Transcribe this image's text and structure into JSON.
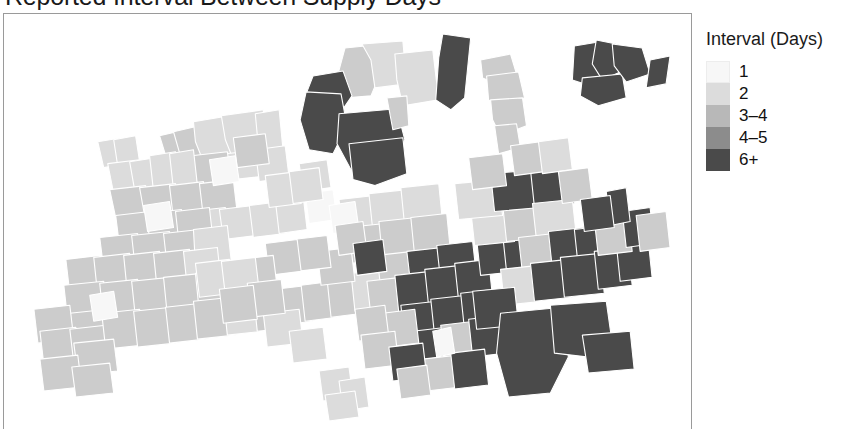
{
  "title": "Reported Interval Between Supply Days",
  "legend": {
    "title": "Interval (Days)",
    "items": [
      {
        "label": "1",
        "color": "#f7f7f7"
      },
      {
        "label": "2",
        "color": "#dcdcdc"
      },
      {
        "label": "3–4",
        "color": "#b8b8b8"
      },
      {
        "label": "4–5",
        "color": "#8c8c8c"
      },
      {
        "label": "6+",
        "color": "#4a4a4a"
      }
    ]
  },
  "chart_data": {
    "type": "map",
    "title": "Reported Interval Between Supply Days",
    "legend_title": "Interval (Days)",
    "categories": [
      "1",
      "2",
      "3–4",
      "4–5",
      "6+"
    ],
    "colors": [
      "#f7f7f7",
      "#dcdcdc",
      "#b8b8b8",
      "#8c8c8c",
      "#4a4a4a"
    ],
    "grid": false,
    "legend_position": "right",
    "panel_background": "#ffffff",
    "polygon_border_color": "#ffffff",
    "region_counts": {
      "1": 6,
      "2": 33,
      "3–4": 41,
      "4–5": 30,
      "6+": 45
    },
    "regions": [
      {
        "id": "r001",
        "class": "4-5",
        "points": "342,34 372,31 376,63 368,82 344,84 335,60"
      },
      {
        "id": "r002",
        "class": "6+",
        "points": "310,62 340,57 349,82 334,104 312,100 303,80"
      },
      {
        "id": "r003",
        "class": "2",
        "points": "359,30 400,27 404,70 372,74 368,46"
      },
      {
        "id": "r004",
        "class": "2",
        "points": "392,40 430,36 436,86 400,92 394,66"
      },
      {
        "id": "r005",
        "class": "6+",
        "points": "440,20 468,24 462,84 448,96 433,86 436,44"
      },
      {
        "id": "r006",
        "class": "6+",
        "points": "303,78 338,80 344,112 330,140 306,136 297,106"
      },
      {
        "id": "r007",
        "class": "6+",
        "points": "336,100 394,95 402,126 388,152 348,156 334,130"
      },
      {
        "id": "r008",
        "class": "6+",
        "points": "346,130 400,124 404,160 372,172 350,166"
      },
      {
        "id": "r009",
        "class": "4-5",
        "points": "384,84 404,82 406,112 390,116"
      },
      {
        "id": "r010",
        "class": "3-4",
        "points": "478,46 508,40 514,60 494,70 480,64"
      },
      {
        "id": "r011",
        "class": "3-4",
        "points": "484,62 516,58 522,84 500,94 486,86"
      },
      {
        "id": "r012",
        "class": "3-4",
        "points": "488,86 520,84 524,112 498,122 490,106"
      },
      {
        "id": "r013",
        "class": "3-4",
        "points": "492,112 514,110 518,134 496,140"
      },
      {
        "id": "r014",
        "class": "6+",
        "points": "572,32 596,28 604,60 588,72 570,66"
      },
      {
        "id": "r015",
        "class": "6+",
        "points": "594,26 614,30 618,58 600,66 590,50"
      },
      {
        "id": "r016",
        "class": "6+",
        "points": "580,64 620,60 624,84 596,92 578,82"
      },
      {
        "id": "r017",
        "class": "6+",
        "points": "610,30 640,34 648,60 624,68 612,52"
      },
      {
        "id": "r018",
        "class": "6+",
        "points": "648,46 668,42 664,70 644,74"
      },
      {
        "id": "r019",
        "class": "4-5",
        "points": "156,122 182,116 186,142 164,148"
      },
      {
        "id": "r020",
        "class": "3-4",
        "points": "170,118 196,112 202,140 178,146"
      },
      {
        "id": "r021",
        "class": "2",
        "points": "190,108 226,102 232,142 200,148 192,128"
      },
      {
        "id": "r022",
        "class": "2",
        "points": "218,102 260,96 264,140 230,146 222,126"
      },
      {
        "id": "r023",
        "class": "2",
        "points": "252,100 276,96 280,138 256,142"
      },
      {
        "id": "r024",
        "class": "2",
        "points": "222,140 262,136 266,162 230,166"
      },
      {
        "id": "r025",
        "class": "2",
        "points": "252,136 282,132 286,164 256,168"
      },
      {
        "id": "r026",
        "class": "3-4",
        "points": "188,142 224,138 228,168 194,172"
      },
      {
        "id": "r027",
        "class": "2",
        "points": "94,128 118,124 122,150 100,154"
      },
      {
        "id": "r028",
        "class": "2",
        "points": "110,126 132,122 136,148 114,152"
      },
      {
        "id": "r029",
        "class": "2",
        "points": "104,150 136,146 140,176 110,180"
      },
      {
        "id": "r030",
        "class": "2",
        "points": "126,148 152,144 156,178 132,182"
      },
      {
        "id": "r031",
        "class": "2",
        "points": "146,142 172,138 176,174 150,178"
      },
      {
        "id": "r032",
        "class": "2",
        "points": "166,140 190,136 194,172 170,176"
      },
      {
        "id": "r033",
        "class": "3-4",
        "points": "106,176 142,172 146,200 112,204"
      },
      {
        "id": "r034",
        "class": "3-4",
        "points": "136,174 172,170 176,204 142,208"
      },
      {
        "id": "r035",
        "class": "3-4",
        "points": "166,172 200,168 204,202 170,206"
      },
      {
        "id": "r036",
        "class": "3-4",
        "points": "196,170 230,166 234,200 200,204"
      },
      {
        "id": "r037",
        "class": "2",
        "points": "186,198 222,194 226,222 190,226"
      },
      {
        "id": "r038",
        "class": "2",
        "points": "216,196 250,192 254,222 220,226"
      },
      {
        "id": "r039",
        "class": "2",
        "points": "246,192 278,188 282,220 250,224"
      },
      {
        "id": "r040",
        "class": "2",
        "points": "272,186 300,182 304,216 276,220"
      },
      {
        "id": "r041",
        "class": "3-4",
        "points": "112,202 146,198 150,230 116,234"
      },
      {
        "id": "r042",
        "class": "3-4",
        "points": "142,200 178,196 182,232 148,236"
      },
      {
        "id": "r043",
        "class": "3-4",
        "points": "172,198 206,194 210,230 176,234"
      },
      {
        "id": "r044",
        "class": "3-4",
        "points": "96,224 134,220 138,252 100,256"
      },
      {
        "id": "r045",
        "class": "3-4",
        "points": "128,222 166,218 170,254 132,258"
      },
      {
        "id": "r046",
        "class": "3-4",
        "points": "160,220 196,216 200,252 164,256"
      },
      {
        "id": "r047",
        "class": "2",
        "points": "190,216 224,212 228,248 192,252"
      },
      {
        "id": "r048",
        "class": "3-4",
        "points": "62,246 96,242 100,276 66,280"
      },
      {
        "id": "r049",
        "class": "3-4",
        "points": "90,244 126,240 130,278 94,282"
      },
      {
        "id": "r050",
        "class": "3-4",
        "points": "120,242 156,238 160,278 124,282"
      },
      {
        "id": "r051",
        "class": "3-4",
        "points": "150,240 186,236 190,276 154,280"
      },
      {
        "id": "r052",
        "class": "2",
        "points": "180,238 214,234 218,272 184,276"
      },
      {
        "id": "r053",
        "class": "3-4",
        "points": "60,272 100,268 104,304 64,308"
      },
      {
        "id": "r054",
        "class": "3-4",
        "points": "96,270 134,266 138,304 100,308"
      },
      {
        "id": "r055",
        "class": "3-4",
        "points": "128,268 166,264 170,302 132,306"
      },
      {
        "id": "r056",
        "class": "3-4",
        "points": "160,264 198,260 202,300 164,304"
      },
      {
        "id": "r057",
        "class": "3-4",
        "points": "192,260 226,256 230,296 196,300"
      },
      {
        "id": "r058",
        "class": "3-4",
        "points": "66,300 104,296 108,330 70,334"
      },
      {
        "id": "r059",
        "class": "4-5",
        "points": "30,296 66,292 70,326 34,330"
      },
      {
        "id": "r060",
        "class": "4-5",
        "points": "36,318 72,314 76,348 40,352"
      },
      {
        "id": "r061",
        "class": "4-5",
        "points": "66,316 102,312 106,346 70,350"
      },
      {
        "id": "r062",
        "class": "3-4",
        "points": "98,300 136,296 140,332 102,336"
      },
      {
        "id": "r063",
        "class": "3-4",
        "points": "130,298 168,294 172,330 134,334"
      },
      {
        "id": "r064",
        "class": "3-4",
        "points": "162,294 198,290 202,326 166,330"
      },
      {
        "id": "r065",
        "class": "3-4",
        "points": "190,288 228,284 232,322 194,326"
      },
      {
        "id": "r066",
        "class": "2",
        "points": "220,284 256,280 260,318 224,322"
      },
      {
        "id": "r067",
        "class": "3-4",
        "points": "250,280 288,276 292,314 254,318"
      },
      {
        "id": "r068",
        "class": "3-4",
        "points": "70,330 110,326 114,358 74,362"
      },
      {
        "id": "r069",
        "class": "3-4",
        "points": "36,346 74,342 78,374 40,378"
      },
      {
        "id": "r070",
        "class": "3-4",
        "points": "68,354 106,350 110,380 72,384"
      },
      {
        "id": "r071",
        "class": "3-4",
        "points": "272,276 306,272 310,308 276,312"
      },
      {
        "id": "r072",
        "class": "3-4",
        "points": "298,272 330,268 334,304 302,308"
      },
      {
        "id": "r073",
        "class": "3-4",
        "points": "324,266 356,262 360,300 328,304"
      },
      {
        "id": "r074",
        "class": "2",
        "points": "348,260 380,256 384,294 352,298"
      },
      {
        "id": "r075",
        "class": "2",
        "points": "336,186 372,182 376,216 340,220"
      },
      {
        "id": "r076",
        "class": "2",
        "points": "366,180 404,176 408,214 370,218"
      },
      {
        "id": "r077",
        "class": "2",
        "points": "398,174 436,170 440,210 402,214"
      },
      {
        "id": "r078",
        "class": "3-4",
        "points": "344,214 382,210 386,246 348,250"
      },
      {
        "id": "r079",
        "class": "3-4",
        "points": "376,208 414,204 418,244 380,248"
      },
      {
        "id": "r080",
        "class": "3-4",
        "points": "408,204 444,200 448,240 412,244"
      },
      {
        "id": "r081",
        "class": "4-5",
        "points": "374,242 410,238 414,272 378,276"
      },
      {
        "id": "r082",
        "class": "6+",
        "points": "404,238 440,234 444,268 408,272"
      },
      {
        "id": "r083",
        "class": "6+",
        "points": "434,232 470,228 474,264 438,268"
      },
      {
        "id": "r084",
        "class": "4-5",
        "points": "364,268 398,264 402,298 368,302"
      },
      {
        "id": "r085",
        "class": "6+",
        "points": "392,262 428,258 432,296 396,300"
      },
      {
        "id": "r086",
        "class": "6+",
        "points": "422,256 458,252 462,290 426,294"
      },
      {
        "id": "r087",
        "class": "6+",
        "points": "452,250 486,246 490,284 456,288"
      },
      {
        "id": "r088",
        "class": "6+",
        "points": "398,292 434,288 438,324 402,328"
      },
      {
        "id": "r089",
        "class": "6+",
        "points": "428,286 464,282 468,320 432,324"
      },
      {
        "id": "r090",
        "class": "6+",
        "points": "458,280 492,276 496,314 462,318"
      },
      {
        "id": "r091",
        "class": "6+",
        "points": "410,318 444,314 448,348 414,352"
      },
      {
        "id": "r092",
        "class": "4-5",
        "points": "438,312 472,308 476,344 442,348"
      },
      {
        "id": "r093",
        "class": "6+",
        "points": "466,306 500,302 504,340 470,344"
      },
      {
        "id": "r094",
        "class": "4-5",
        "points": "420,346 454,342 458,374 424,378"
      },
      {
        "id": "r095",
        "class": "6+",
        "points": "448,340 482,336 486,372 452,376"
      },
      {
        "id": "r096",
        "class": "6+",
        "points": "474,226 512,222 516,258 478,262"
      },
      {
        "id": "r097",
        "class": "6+",
        "points": "500,220 536,216 540,254 504,258"
      },
      {
        "id": "r098",
        "class": "2",
        "points": "468,196 508,192 512,228 472,232"
      },
      {
        "id": "r099",
        "class": "3-4",
        "points": "500,190 542,186 546,224 504,228"
      },
      {
        "id": "r100",
        "class": "2",
        "points": "452,170 496,166 500,202 456,206"
      },
      {
        "id": "r101",
        "class": "6+",
        "points": "488,160 534,156 538,194 492,198"
      },
      {
        "id": "r102",
        "class": "6+",
        "points": "528,156 568,152 572,190 532,194"
      },
      {
        "id": "r103",
        "class": "4-5",
        "points": "466,144 500,140 504,172 470,176"
      },
      {
        "id": "r104",
        "class": "2",
        "points": "530,190 570,186 574,222 534,226"
      },
      {
        "id": "r105",
        "class": "3-4",
        "points": "516,224 552,220 556,256 520,260"
      },
      {
        "id": "r106",
        "class": "6+",
        "points": "546,218 582,214 586,252 550,256"
      },
      {
        "id": "r107",
        "class": "6+",
        "points": "572,216 606,212 610,250 576,254"
      },
      {
        "id": "r108",
        "class": "2",
        "points": "498,256 536,252 540,288 502,292"
      },
      {
        "id": "r109",
        "class": "6+",
        "points": "528,250 566,246 570,284 532,288"
      },
      {
        "id": "r110",
        "class": "6+",
        "points": "558,244 598,240 602,280 562,284"
      },
      {
        "id": "r111",
        "class": "6+",
        "points": "592,238 626,234 630,272 596,276"
      },
      {
        "id": "r112",
        "class": "6+",
        "points": "614,230 646,226 650,264 618,268"
      },
      {
        "id": "r113",
        "class": "4-5",
        "points": "592,206 626,202 630,238 596,242"
      },
      {
        "id": "r114",
        "class": "6+",
        "points": "620,198 648,194 652,230 624,234"
      },
      {
        "id": "r115",
        "class": "6+",
        "points": "604,178 624,174 628,208 608,212"
      },
      {
        "id": "r116",
        "class": "4-5",
        "points": "634,202 664,198 668,234 638,238"
      },
      {
        "id": "r117",
        "class": "6+",
        "points": "470,278 512,274 516,312 474,316"
      },
      {
        "id": "r118",
        "class": "6+",
        "points": "498,300 560,294 566,344 548,380 506,384 494,340"
      },
      {
        "id": "r119",
        "class": "6+",
        "points": "548,292 604,288 610,330 586,344 552,340"
      },
      {
        "id": "r120",
        "class": "6+",
        "points": "580,322 628,318 632,356 586,360"
      },
      {
        "id": "r121",
        "class": "2",
        "points": "316,358 346,354 350,384 320,388"
      },
      {
        "id": "r122",
        "class": "2",
        "points": "336,368 362,364 366,394 340,398"
      },
      {
        "id": "r123",
        "class": "2",
        "points": "322,382 352,378 356,404 326,408"
      },
      {
        "id": "r124",
        "class": "2",
        "points": "296,150 324,146 328,174 300,178"
      },
      {
        "id": "r125",
        "class": "4-5",
        "points": "230,124 262,120 266,150 234,154"
      },
      {
        "id": "r126",
        "class": "1",
        "points": "302,180 330,176 334,206 306,210"
      },
      {
        "id": "r127",
        "class": "1",
        "points": "326,192 352,188 356,216 330,220"
      },
      {
        "id": "r128",
        "class": "1",
        "points": "206,146 232,142 236,168 210,172"
      },
      {
        "id": "r129",
        "class": "1",
        "points": "140,192 166,188 170,214 144,218"
      },
      {
        "id": "r130",
        "class": "1",
        "points": "86,282 110,278 114,304 90,308"
      },
      {
        "id": "r131",
        "class": "1",
        "points": "430,318 448,314 452,340 434,344"
      },
      {
        "id": "r132",
        "class": "4-5",
        "points": "380,300 412,296 416,330 384,334"
      },
      {
        "id": "r133",
        "class": "3-4",
        "points": "352,296 382,292 386,324 356,328"
      },
      {
        "id": "r134",
        "class": "4-5",
        "points": "358,322 392,318 396,352 362,356"
      },
      {
        "id": "r135",
        "class": "6+",
        "points": "386,334 420,330 424,364 390,368"
      },
      {
        "id": "r136",
        "class": "4-5",
        "points": "394,356 424,352 428,382 398,386"
      },
      {
        "id": "r137",
        "class": "2",
        "points": "260,300 296,296 300,330 264,334"
      },
      {
        "id": "r138",
        "class": "2",
        "points": "286,318 320,314 324,346 290,350"
      },
      {
        "id": "r139",
        "class": "4-5",
        "points": "314,238 348,234 352,268 318,272"
      },
      {
        "id": "r140",
        "class": "4-5",
        "points": "290,226 324,222 328,254 294,258"
      },
      {
        "id": "r141",
        "class": "3-4",
        "points": "262,230 294,226 298,258 266,262"
      },
      {
        "id": "r142",
        "class": "3-4",
        "points": "236,246 270,242 274,274 240,278"
      },
      {
        "id": "r143",
        "class": "4-5",
        "points": "332,212 360,208 364,238 336,242"
      },
      {
        "id": "r144",
        "class": "6+",
        "points": "350,230 380,226 384,258 354,262"
      },
      {
        "id": "r145",
        "class": "4-5",
        "points": "508,132 538,128 542,158 512,162"
      },
      {
        "id": "r146",
        "class": "2",
        "points": "536,128 566,124 570,156 540,160"
      },
      {
        "id": "r147",
        "class": "4-5",
        "points": "556,158 586,154 590,186 560,190"
      },
      {
        "id": "r148",
        "class": "6+",
        "points": "578,186 608,182 612,214 582,218"
      },
      {
        "id": "r149",
        "class": "2",
        "points": "262,162 294,158 298,190 266,194"
      },
      {
        "id": "r150",
        "class": "2",
        "points": "286,158 316,154 320,186 290,190"
      },
      {
        "id": "r151",
        "class": "2",
        "points": "192,250 226,246 230,280 196,284"
      },
      {
        "id": "r152",
        "class": "2",
        "points": "218,248 252,244 256,278 222,282"
      },
      {
        "id": "r153",
        "class": "3-4",
        "points": "244,270 278,266 282,300 248,304"
      },
      {
        "id": "r154",
        "class": "3-4",
        "points": "216,276 250,272 254,306 220,310"
      }
    ]
  }
}
